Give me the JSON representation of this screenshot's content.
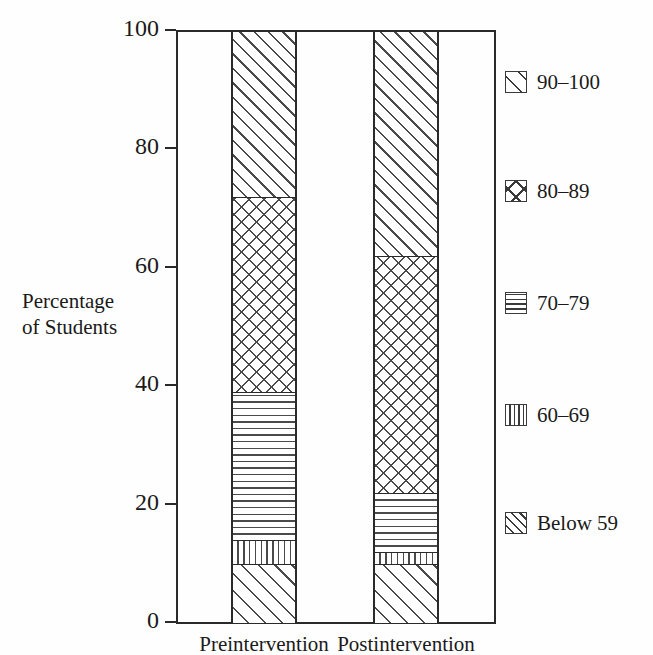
{
  "figure": {
    "clipped_title_remnant": "",
    "y_axis_title_line1": "Percentage",
    "y_axis_title_line2": "of Students"
  },
  "chart_data": {
    "type": "bar",
    "subtype": "stacked-bar-percentage",
    "title": "",
    "xlabel": "",
    "ylabel": "Percentage of Students",
    "ylim": [
      0,
      100
    ],
    "yticks": [
      0,
      20,
      40,
      60,
      80,
      100
    ],
    "ytick_labels": [
      "0",
      "20",
      "40",
      "60",
      "80",
      "100"
    ],
    "grid": false,
    "legend_position": "right",
    "categories": [
      "Preintervention",
      "Postintervention"
    ],
    "series": [
      {
        "name": "Below 59",
        "pattern": "diagonal-dense",
        "values": [
          10,
          10
        ]
      },
      {
        "name": "60–69",
        "pattern": "vertical",
        "values": [
          4,
          2
        ]
      },
      {
        "name": "70–79",
        "pattern": "horizontal",
        "values": [
          25,
          10
        ]
      },
      {
        "name": "80–89",
        "pattern": "crosshatch",
        "values": [
          33,
          40
        ]
      },
      {
        "name": "90–100",
        "pattern": "diagonal-wide",
        "values": [
          28,
          38
        ]
      }
    ],
    "cumulative_boundaries": {
      "Preintervention": [
        10,
        14,
        39,
        72,
        100
      ],
      "Postintervention": [
        10,
        12,
        22,
        62,
        100
      ]
    },
    "colors": {
      "line": "#2a2a2a",
      "hatch": "#4a4a4a",
      "fill": "#ffffff",
      "background": "#ffffff"
    }
  },
  "legend": {
    "items": [
      {
        "label": "90–100",
        "pattern": "diagonal-wide"
      },
      {
        "label": "80–89",
        "pattern": "crosshatch"
      },
      {
        "label": "70–79",
        "pattern": "horizontal"
      },
      {
        "label": "60–69",
        "pattern": "vertical"
      },
      {
        "label": "Below 59",
        "pattern": "diagonal-dense"
      }
    ]
  }
}
